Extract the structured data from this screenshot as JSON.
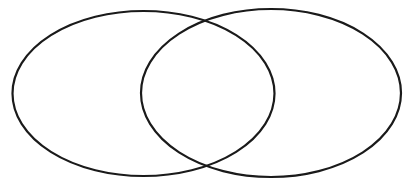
{
  "figure": {
    "type": "venn-diagram",
    "background_color": "#ffffff",
    "stroke_color": "#1a1a1a",
    "stroke_width": 2.2,
    "canvas_width": 412,
    "canvas_height": 184,
    "set_count": 2,
    "filled": false,
    "labels_present": false
  },
  "shapes": {
    "left_ellipse": {
      "name": "left-set",
      "cx": 143.5,
      "cy": 93.5,
      "rx": 131,
      "ry": 82.5,
      "fill": "none",
      "stroke": "#1a1a1a"
    },
    "right_ellipse": {
      "name": "right-set",
      "cx": 271,
      "cy": 93,
      "rx": 130,
      "ry": 84,
      "fill": "none",
      "stroke": "#1a1a1a"
    },
    "intersection": {
      "name": "overlap-lens",
      "top_point_x": 207,
      "top_point_y": 10,
      "bottom_point_x": 207,
      "bottom_point_y": 172,
      "left_x": 141,
      "right_x": 275
    }
  },
  "ghost_watermark": {
    "visible": false,
    "note": "faint near-white residual marks",
    "mark_a": "    ",
    "mark_b": "   ",
    "mark_c": "   "
  }
}
